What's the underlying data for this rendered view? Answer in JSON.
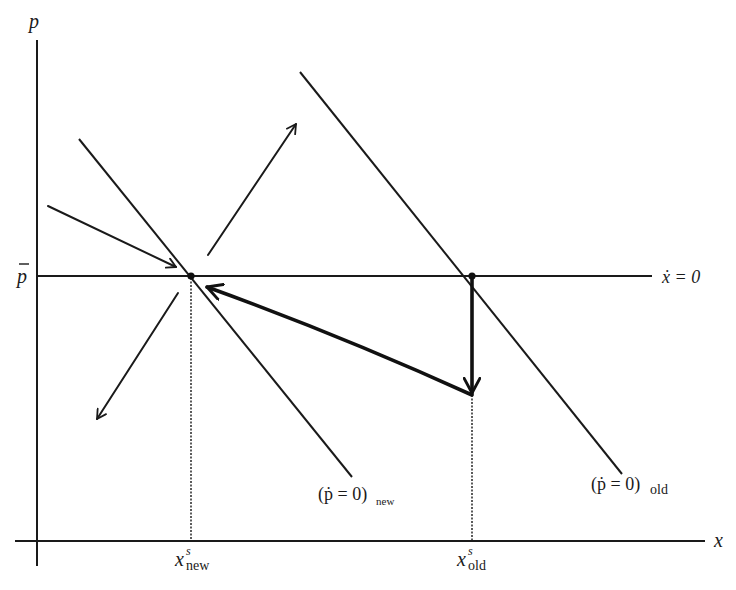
{
  "diagram": {
    "type": "phase-diagram",
    "axes": {
      "y_label": "p",
      "x_label": "x"
    },
    "labels": {
      "p_bar": "p",
      "x_dot_locus": "ẋ = 0",
      "p_dot_new_main": "(ṗ = 0)",
      "p_dot_new_sub": "new",
      "p_dot_old_main": "(ṗ = 0)",
      "p_dot_old_sub": "old",
      "xs_new_base": "x",
      "xs_new_sup": "s",
      "xs_new_sub": "new",
      "xs_old_base": "x",
      "xs_old_sup": "s",
      "xs_old_sub": "old"
    },
    "loci": [
      {
        "name": "x-dot-zero",
        "kind": "horizontal",
        "level": "p-bar"
      },
      {
        "name": "p-dot-zero-new",
        "kind": "downward-sloping",
        "position": "left"
      },
      {
        "name": "p-dot-zero-old",
        "kind": "downward-sloping",
        "position": "right"
      }
    ],
    "equilibria": [
      {
        "name": "new-steady-state",
        "x": "x^s_new",
        "p": "p-bar"
      },
      {
        "name": "old-steady-state",
        "x": "x^s_old",
        "p": "p-bar"
      }
    ],
    "dynamics_arrows": [
      {
        "name": "converging-from-upper-left",
        "style": "thin",
        "toward": "new-steady-state"
      },
      {
        "name": "diverging-upper-right",
        "style": "thin",
        "away_from": "new-steady-state"
      },
      {
        "name": "diverging-lower-left",
        "style": "thin",
        "away_from": "new-steady-state"
      },
      {
        "name": "price-jump-down",
        "style": "thick",
        "from": "old-steady-state",
        "direction": "down"
      },
      {
        "name": "saddle-path-adjustment",
        "style": "thick",
        "toward": "new-steady-state"
      }
    ]
  }
}
